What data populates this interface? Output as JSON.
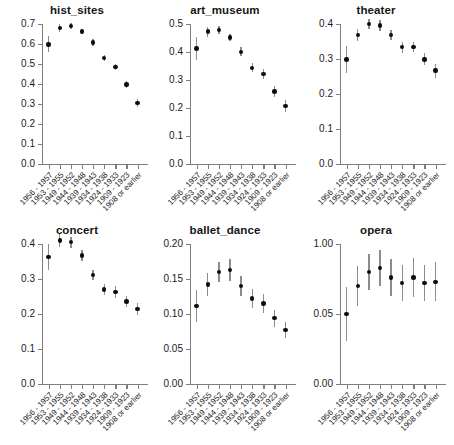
{
  "figure": {
    "title": "",
    "background": "#ffffff",
    "dot_color": "#0d0d0d",
    "errorbar_color": "#8c8c8c",
    "axis_color": "#7d7d7d"
  },
  "categories": [
    "1956 - 1957",
    "1953 - 1955",
    "1949 - 1952",
    "1944 - 1948",
    "1939 - 1943",
    "1934 - 1938",
    "1924 - 1933",
    "1909 - 1923",
    "1908 or earlier"
  ],
  "chart_data": [
    {
      "type": "scatter",
      "title": "hist_sites",
      "xlabel": "",
      "ylabel": "",
      "grid": false,
      "legend": "none",
      "categories": [
        "1956 - 1957",
        "1953 - 1955",
        "1949 - 1952",
        "1944 - 1948",
        "1939 - 1943",
        "1934 - 1938",
        "1924 - 1933",
        "1909 - 1923",
        "1908 or earlier"
      ],
      "values": [
        0.598,
        0.68,
        0.69,
        0.663,
        0.608,
        0.53,
        0.485,
        0.398,
        0.305
      ],
      "err_low": [
        0.558,
        0.662,
        0.676,
        0.649,
        0.592,
        0.514,
        0.468,
        0.38,
        0.283
      ],
      "err_high": [
        0.638,
        0.698,
        0.704,
        0.677,
        0.624,
        0.546,
        0.502,
        0.416,
        0.327
      ],
      "ylim": [
        0.0,
        0.7
      ],
      "yticks": [
        0.0,
        0.1,
        0.2,
        0.3,
        0.4,
        0.5,
        0.6,
        0.7
      ],
      "ytick_labels": [
        "0.0",
        "0.1",
        "0.2",
        "0.3",
        "0.4",
        "0.5",
        "0.6",
        "0.7"
      ]
    },
    {
      "type": "scatter",
      "title": "art_museum",
      "xlabel": "",
      "ylabel": "",
      "grid": false,
      "legend": "none",
      "categories": [
        "1956 - 1957",
        "1953 - 1955",
        "1949 - 1952",
        "1944 - 1948",
        "1939 - 1943",
        "1934 - 1938",
        "1924 - 1933",
        "1909 - 1923",
        "1908 or earlier"
      ],
      "values": [
        0.412,
        0.473,
        0.479,
        0.452,
        0.401,
        0.343,
        0.321,
        0.259,
        0.207
      ],
      "err_low": [
        0.372,
        0.455,
        0.465,
        0.438,
        0.385,
        0.327,
        0.304,
        0.241,
        0.187
      ],
      "err_high": [
        0.452,
        0.491,
        0.493,
        0.466,
        0.417,
        0.359,
        0.338,
        0.277,
        0.227
      ],
      "ylim": [
        0.0,
        0.5
      ],
      "yticks": [
        0.0,
        0.1,
        0.2,
        0.3,
        0.4,
        0.5
      ],
      "ytick_labels": [
        "0.0",
        "0.1",
        "0.2",
        "0.3",
        "0.4",
        "0.5"
      ]
    },
    {
      "type": "scatter",
      "title": "theater",
      "xlabel": "",
      "ylabel": "",
      "grid": false,
      "legend": "none",
      "categories": [
        "1956 - 1957",
        "1953 - 1955",
        "1949 - 1952",
        "1944 - 1948",
        "1939 - 1943",
        "1934 - 1938",
        "1924 - 1933",
        "1909 - 1923",
        "1908 or earlier"
      ],
      "values": [
        0.299,
        0.368,
        0.4,
        0.396,
        0.368,
        0.334,
        0.334,
        0.299,
        0.267
      ],
      "err_low": [
        0.261,
        0.35,
        0.385,
        0.381,
        0.353,
        0.318,
        0.32,
        0.282,
        0.247
      ],
      "err_high": [
        0.337,
        0.386,
        0.415,
        0.411,
        0.383,
        0.35,
        0.348,
        0.316,
        0.287
      ],
      "ylim": [
        0.0,
        0.4
      ],
      "yticks": [
        0.0,
        0.1,
        0.2,
        0.3,
        0.4
      ],
      "ytick_labels": [
        "0.0",
        "0.1",
        "0.2",
        "0.3",
        "0.4"
      ]
    },
    {
      "type": "scatter",
      "title": "concert",
      "xlabel": "",
      "ylabel": "",
      "grid": false,
      "legend": "none",
      "categories": [
        "1956 - 1957",
        "1953 - 1955",
        "1949 - 1952",
        "1944 - 1948",
        "1939 - 1943",
        "1934 - 1938",
        "1924 - 1933",
        "1909 - 1923",
        "1908 or earlier"
      ],
      "values": [
        0.363,
        0.41,
        0.405,
        0.367,
        0.312,
        0.27,
        0.263,
        0.236,
        0.214
      ],
      "err_low": [
        0.325,
        0.391,
        0.39,
        0.352,
        0.297,
        0.254,
        0.247,
        0.22,
        0.196
      ],
      "err_high": [
        0.401,
        0.429,
        0.42,
        0.382,
        0.327,
        0.286,
        0.279,
        0.252,
        0.232
      ],
      "ylim": [
        0.0,
        0.4
      ],
      "yticks": [
        0.0,
        0.1,
        0.2,
        0.3,
        0.4
      ],
      "ytick_labels": [
        "0.0",
        "0.1",
        "0.2",
        "0.3",
        "0.4"
      ]
    },
    {
      "type": "scatter",
      "title": "ballet_dance",
      "xlabel": "",
      "ylabel": "",
      "grid": false,
      "legend": "none",
      "categories": [
        "1956 - 1957",
        "1953 - 1955",
        "1949 - 1952",
        "1944 - 1948",
        "1939 - 1943",
        "1934 - 1938",
        "1924 - 1933",
        "1909 - 1923",
        "1908 or earlier"
      ],
      "values": [
        0.111,
        0.142,
        0.16,
        0.163,
        0.14,
        0.122,
        0.115,
        0.094,
        0.077
      ],
      "err_low": [
        0.088,
        0.125,
        0.146,
        0.147,
        0.126,
        0.108,
        0.102,
        0.082,
        0.065
      ],
      "err_high": [
        0.134,
        0.159,
        0.174,
        0.179,
        0.154,
        0.136,
        0.128,
        0.106,
        0.089
      ],
      "ylim": [
        0.0,
        0.2
      ],
      "yticks": [
        0.0,
        0.05,
        0.1,
        0.15,
        0.2
      ],
      "ytick_labels": [
        "0.00",
        "0.05",
        "0.10",
        "0.15",
        "0.20"
      ]
    },
    {
      "type": "scatter",
      "title": "opera",
      "xlabel": "",
      "ylabel": "",
      "grid": false,
      "legend": "none",
      "categories": [
        "1956 - 1957",
        "1953 - 1955",
        "1949 - 1952",
        "1944 - 1948",
        "1939 - 1943",
        "1934 - 1938",
        "1924 - 1933",
        "1909 - 1923",
        "1908 or earlier"
      ],
      "values": [
        0.05,
        0.07,
        0.08,
        0.083,
        0.076,
        0.072,
        0.076,
        0.072,
        0.073
      ],
      "err_low": [
        0.031,
        0.056,
        0.067,
        0.07,
        0.063,
        0.059,
        0.062,
        0.059,
        0.059
      ],
      "err_high": [
        0.069,
        0.084,
        0.093,
        0.096,
        0.089,
        0.085,
        0.09,
        0.085,
        0.087
      ],
      "ylim": [
        0.0,
        0.1
      ],
      "yticks": [
        0.0,
        0.05,
        0.1
      ],
      "ytick_labels": [
        "0.00",
        "0.05",
        "1.00"
      ]
    }
  ]
}
